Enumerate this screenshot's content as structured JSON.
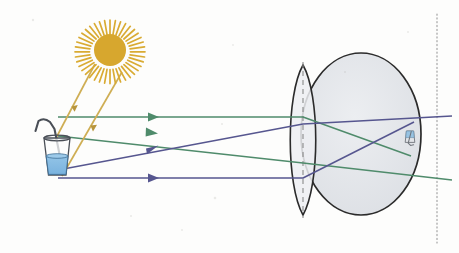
{
  "figure": {
    "background_color": "#fdfdfc",
    "width": 459,
    "height": 253
  },
  "colors": {
    "sun": "#d9ab33",
    "sun_core": "#d7a72e",
    "sun_ray_line": "#cfae54",
    "ray_green": "#4f8b6b",
    "ray_blue": "#56568f",
    "eyeball_outline": "#2b2b2b",
    "eyeball_fill": "#e2e4e8",
    "lens_outline": "#2b2b2b",
    "lens_fill": "#eceef1",
    "axis_dashed": "#8a8a8a",
    "axis_dotted": "#9a9a9a",
    "glass_outline": "#4a4f57",
    "water_fill": "#7fb8e0",
    "water_outline": "#3d6e96",
    "straw": "#4a4f57"
  },
  "objects": {
    "sun": {
      "name": "sun",
      "label": "Sun",
      "center_x": 110,
      "center_y": 50,
      "core_radius": 16,
      "spike_count": 34,
      "spike_outer": 30
    },
    "glass": {
      "name": "glass-of-water-with-straw",
      "label": "Glass of water with straw",
      "x": 44,
      "y": 138,
      "width": 26,
      "height": 36,
      "water_level_fraction": 0.52,
      "has_straw": true
    },
    "eye": {
      "name": "eyeball",
      "label": "Eyeball",
      "center_x": 361,
      "center_y": 134,
      "radius_x": 60,
      "radius_y": 81
    },
    "lens": {
      "name": "eye-lens",
      "label": "Lens / cornea",
      "center_x": 303,
      "top_y": 65,
      "bottom_y": 215,
      "half_width": 17
    },
    "optical_axis_dashed": {
      "name": "optical-axis-dashed-line",
      "x": 303,
      "y_start": 62,
      "y_end": 218
    },
    "screen_dotted": {
      "name": "screen-dotted-line",
      "x": 437,
      "y_start": 14,
      "y_end": 243
    },
    "retinal_image": {
      "name": "inverted-retinal-image",
      "label": "Inverted image of glass on retina",
      "x": 404,
      "y": 118,
      "width": 12,
      "height": 38
    }
  },
  "sun_rays": [
    {
      "name": "sun-ray-upper",
      "from_x": 95,
      "from_y": 64,
      "to_x": 55,
      "to_y": 140,
      "arrow_at": 0.55
    },
    {
      "name": "sun-ray-lower",
      "from_x": 122,
      "from_y": 72,
      "to_x": 62,
      "to_y": 176,
      "arrow_at": 0.55
    }
  ],
  "light_rays": [
    {
      "name": "green-ray-parallel",
      "color_key": "ray_green",
      "source": "object-top",
      "points": [
        [
          58,
          117
        ],
        [
          303,
          117
        ],
        [
          411,
          156
        ]
      ],
      "arrow_at_x": 152,
      "description": "Parallel ray from top of object refracts through focal point toward retina"
    },
    {
      "name": "green-ray-through-center",
      "color_key": "ray_green",
      "source": "object-top",
      "points": [
        [
          58,
          136
        ],
        [
          303,
          163
        ],
        [
          452,
          180
        ]
      ],
      "arrow_at_x": 152,
      "description": "Ray from top of object through lens centre continuing to retina"
    },
    {
      "name": "blue-ray-through-center",
      "color_key": "ray_blue",
      "source": "object-bottom",
      "points": [
        [
          58,
          170
        ],
        [
          303,
          124
        ],
        [
          452,
          116
        ]
      ],
      "arrow_at_x": 152,
      "description": "Ray from bottom of object through lens centre continuing upward to retina"
    },
    {
      "name": "blue-ray-parallel",
      "color_key": "ray_blue",
      "source": "object-bottom",
      "points": [
        [
          58,
          178
        ],
        [
          303,
          178
        ],
        [
          414,
          122
        ]
      ],
      "arrow_at_x": 152,
      "description": "Parallel ray from bottom of object refracts downward through focal point"
    }
  ]
}
